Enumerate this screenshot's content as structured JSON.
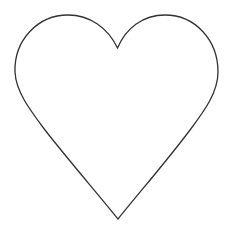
{
  "figure": {
    "shape": "heart-outline",
    "background": "#ffffff",
    "fill": "#ffffff",
    "stroke": "#333333",
    "stroke_width": 1.3
  }
}
